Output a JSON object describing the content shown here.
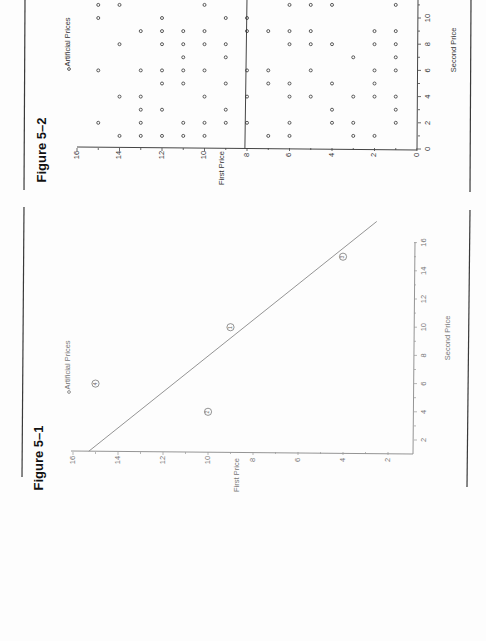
{
  "page": {
    "orientation": "rotated-90-ccw",
    "background": "#fdfdfd"
  },
  "chart_data": [
    {
      "figure_label": "Figure 5–2",
      "type": "scatter",
      "title": "",
      "legend": [
        "◦ Artificial Prices"
      ],
      "legend_text": "Artificial Prices",
      "xlabel": "Second Price",
      "ylabel": "First Price",
      "xlim": [
        0,
        11
      ],
      "ylim": [
        0,
        16
      ],
      "x_ticks": [
        0,
        2,
        4,
        6,
        8,
        10
      ],
      "y_ticks": [
        0,
        2,
        4,
        6,
        8,
        10,
        12,
        14,
        16
      ],
      "reference_line": {
        "label": "",
        "points": [
          [
            0,
            8.1
          ],
          [
            11.5,
            8.0
          ]
        ]
      },
      "series": [
        {
          "name": "Artificial Prices",
          "points_by_second_price": {
            "1": [
              14,
              13,
              12,
              11,
              10,
              7,
              6,
              3,
              2
            ],
            "2": [
              15,
              13,
              11,
              10,
              9,
              8,
              6,
              4,
              3,
              1
            ],
            "3": [
              13,
              12,
              9,
              4,
              1
            ],
            "4": [
              14,
              13,
              10,
              8,
              6,
              5,
              3,
              2,
              1
            ],
            "5": [
              12,
              11,
              9,
              7,
              6,
              4,
              2
            ],
            "6": [
              15,
              13,
              12,
              11,
              10,
              8,
              7,
              5,
              2,
              1
            ],
            "7": [
              11,
              9,
              3,
              1
            ],
            "8": [
              14,
              12,
              11,
              10,
              9,
              6,
              5,
              4,
              2,
              1
            ],
            "9": [
              13,
              12,
              11,
              10,
              8,
              7,
              6,
              5,
              2,
              1
            ],
            "10": [
              15,
              12,
              9,
              8
            ],
            "11": [
              15,
              14,
              10,
              6,
              5,
              4,
              1
            ]
          }
        }
      ]
    },
    {
      "figure_label": "Figure 5–1",
      "type": "scatter",
      "title": "",
      "legend_text": "Artificial Prices",
      "xlabel": "Second Price",
      "ylabel": "First Price",
      "xlim": [
        1,
        17
      ],
      "ylim": [
        1,
        16
      ],
      "x_ticks": [
        2,
        4,
        6,
        8,
        10,
        12,
        14,
        16
      ],
      "y_ticks": [
        2,
        4,
        6,
        8,
        10,
        12,
        14,
        16
      ],
      "reference_line": {
        "label": "",
        "points": [
          [
            1.2,
            15.3
          ],
          [
            17.5,
            2.5
          ]
        ]
      },
      "series": [
        {
          "name": "Artificial Prices",
          "points": [
            {
              "label": "1",
              "second_price": 10,
              "first_price": 9
            },
            {
              "label": "2",
              "second_price": 4,
              "first_price": 10
            },
            {
              "label": "3",
              "second_price": 15,
              "first_price": 4
            },
            {
              "label": "4",
              "second_price": 6,
              "first_price": 15
            }
          ]
        }
      ]
    }
  ]
}
